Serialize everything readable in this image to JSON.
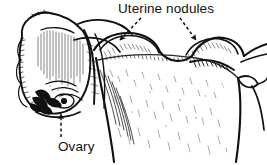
{
  "figure": {
    "background_color": "#ffffff",
    "ink_color": "#111111",
    "width": 267,
    "height": 165
  },
  "labels": {
    "nodules": "Uterine nodules",
    "ovary": "Ovary"
  },
  "annotations": [
    {
      "name": "leader-nodule-left",
      "label_ref": "nodules",
      "style": "dashed",
      "arrowhead": "filled-triangle",
      "from": [
        141,
        18
      ],
      "to": [
        118,
        42
      ]
    },
    {
      "name": "leader-nodule-right",
      "label_ref": "nodules",
      "style": "dashed",
      "arrowhead": "filled-triangle",
      "from": [
        180,
        18
      ],
      "to": [
        197,
        42
      ]
    },
    {
      "name": "leader-ovary",
      "label_ref": "ovary",
      "style": "dashed",
      "arrowhead": "filled-triangle",
      "from": [
        61,
        137
      ],
      "to": [
        61,
        112
      ]
    }
  ],
  "structures": [
    {
      "name": "ovary",
      "description": "lobed ovary at left with vertical hatch shading"
    },
    {
      "name": "fimbriae",
      "description": "dark fimbrial fronds at lower left of ovary"
    },
    {
      "name": "uterine-nodule-left",
      "description": "rounded nodular bump on uterine fundus, left"
    },
    {
      "name": "uterine-nodule-right",
      "description": "rounded nodular bump on uterine fundus, right"
    },
    {
      "name": "uterine-body",
      "description": "stippled uterine corpus below fundus"
    },
    {
      "name": "broad-ligament-right",
      "description": "branching ligament/tube extending to right edge"
    },
    {
      "name": "fallopian-tube",
      "description": "tube arcing from ovary across to uterus"
    }
  ]
}
